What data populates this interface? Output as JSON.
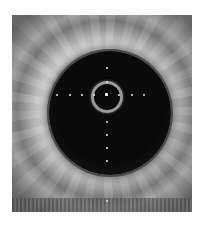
{
  "image": {
    "subject": "intravascular ultrasound cross-section",
    "frame": {
      "x": 12,
      "y": 15,
      "width": 180,
      "height": 197
    },
    "lumen": {
      "cx": 98,
      "cy": 98,
      "rx": 61,
      "ry": 62
    },
    "catheter_ring": {
      "cx": 94,
      "cy": 81,
      "r": 15
    },
    "calibration_dots": {
      "horizontal": [
        [
          44,
          79
        ],
        [
          57,
          79
        ],
        [
          69,
          79
        ],
        [
          81,
          79
        ],
        [
          94,
          79
        ],
        [
          106,
          79
        ],
        [
          119,
          79
        ],
        [
          131,
          79
        ]
      ],
      "vertical": [
        [
          94,
          52
        ],
        [
          94,
          66
        ],
        [
          94,
          106
        ],
        [
          94,
          119
        ],
        [
          94,
          132
        ],
        [
          94,
          145
        ],
        [
          94,
          185
        ]
      ]
    },
    "colors": {
      "background": "#ffffff",
      "lumen": "#0a0a0a",
      "tissue_bright": "#e6e6e6",
      "tissue_dark": "#5a5a5a",
      "dots": "#e8e8e8"
    }
  }
}
